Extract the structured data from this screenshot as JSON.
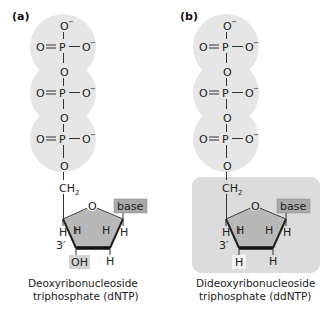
{
  "colors": {
    "phosphate_bg": "#e6e6e6",
    "ring_fill": "#b8b8b8",
    "base_box": "#a9a9a9",
    "highlight_box": "#d4d4d4",
    "ddntp_panel": "#dcdcdc",
    "text": "#222222"
  },
  "panels": [
    {
      "label": "(a)",
      "phosphates": [
        {
          "top": "O",
          "top_charge": "−",
          "left": "O",
          "center": "P",
          "right": "O",
          "right_charge": "−"
        },
        {
          "top": "O",
          "left": "O",
          "center": "P",
          "right": "O",
          "right_charge": "−"
        },
        {
          "top": "O",
          "left": "O",
          "center": "P",
          "right": "O",
          "right_charge": "−"
        }
      ],
      "linker_o": "O",
      "ch2": "CH",
      "ch2_sub": "2",
      "ring_o": "O",
      "base": "base",
      "h_labels": [
        "H",
        "H",
        "H",
        "H",
        "H"
      ],
      "three_prime": "3′",
      "three_prime_group": "OH",
      "caption_line1": "Deoxyribonucleoside",
      "caption_line2": "triphosphate (dNTP)"
    },
    {
      "label": "(b)",
      "phosphates": [
        {
          "top": "O",
          "top_charge": "−",
          "left": "O",
          "center": "P",
          "right": "O",
          "right_charge": "−"
        },
        {
          "top": "O",
          "left": "O",
          "center": "P",
          "right": "O",
          "right_charge": "−"
        },
        {
          "top": "O",
          "left": "O",
          "center": "P",
          "right": "O",
          "right_charge": "−"
        }
      ],
      "linker_o": "O",
      "ch2": "CH",
      "ch2_sub": "2",
      "ring_o": "O",
      "base": "base",
      "h_labels": [
        "H",
        "H",
        "H",
        "H",
        "H"
      ],
      "three_prime": "3′",
      "three_prime_group": "H",
      "caption_line1": "Dideoxyribonucleoside",
      "caption_line2": "triphosphate (ddNTP)"
    }
  ]
}
